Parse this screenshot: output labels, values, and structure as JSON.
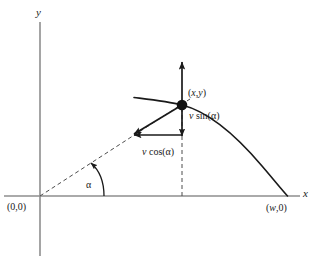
{
  "figure": {
    "colors": {
      "axis": "#8a8a8a",
      "curve": "#1a1a1a",
      "vector": "#1a1a1a",
      "dashed": "#555555",
      "text": "#1a1a1a",
      "background": "#ffffff"
    },
    "axes": {
      "x_label": "x",
      "y_label": "y"
    },
    "labels": {
      "origin": "(0,0)",
      "landing": "(w,0)",
      "point": "(x,y)",
      "vsin": "v sin(α)",
      "vcos": "v cos(α)",
      "angle": "α"
    },
    "label_parts": {
      "origin_open": "(0,0)",
      "landing_w": "w",
      "landing_rest": ",0)",
      "point_x": "x",
      "point_comma": ",",
      "point_y": "y",
      "v_symbol": "v",
      "sin_text": " sin(",
      "cos_text": " cos(",
      "alpha": "α",
      "close_paren": ")"
    }
  },
  "chart_data": {
    "type": "line",
    "xlabel": "x",
    "ylabel": "y",
    "annotations": [
      {
        "name": "origin",
        "text": "(0,0)",
        "x": 0,
        "y": 0
      },
      {
        "name": "landing-point",
        "text": "(w,0)",
        "x": "w",
        "y": 0
      },
      {
        "name": "current-point",
        "text": "(x,y)",
        "x": "x",
        "y": "y"
      },
      {
        "name": "vertical-component",
        "text": "v sin(α)"
      },
      {
        "name": "horizontal-component",
        "text": "v cos(α)"
      },
      {
        "name": "launch-angle",
        "text": "α"
      }
    ],
    "series": [
      {
        "name": "trajectory",
        "style": "solid"
      },
      {
        "name": "launch-direction",
        "style": "dashed"
      }
    ],
    "grid": false,
    "legend": "none"
  }
}
